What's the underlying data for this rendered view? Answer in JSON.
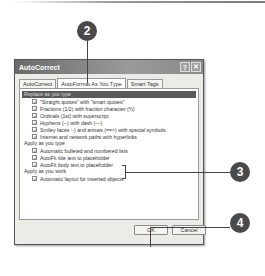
{
  "dialog": {
    "title": "AutoCorrect",
    "help_glyph": "?",
    "close_glyph": "✕",
    "tabs": [
      {
        "label": "AutoCorrect",
        "active": false
      },
      {
        "label": "AutoFormat As You Type",
        "active": true
      },
      {
        "label": "Smart Tags",
        "active": false
      }
    ],
    "section_header": "Replace as you type",
    "replace_options": [
      {
        "label": "\"Straight quotes\" with \"smart quotes\"",
        "checked": true
      },
      {
        "label": "Fractions (1/2) with fraction character (½)",
        "checked": true
      },
      {
        "label": "Ordinals (1st) with superscript",
        "checked": true
      },
      {
        "label": "Hyphens (--) with dash (—)",
        "checked": true
      },
      {
        "label": "Smiley faces :-) and arrows (==>) with special symbols",
        "checked": true
      },
      {
        "label": "Internet and network paths with hyperlinks",
        "checked": true
      }
    ],
    "apply_type_label": "Apply as you type",
    "apply_type_options": [
      {
        "label": "Automatic bulleted and numbered lists",
        "checked": true
      },
      {
        "label": "AutoFit title text to placeholder",
        "checked": true
      },
      {
        "label": "AutoFit body text to placeholder",
        "checked": true
      }
    ],
    "apply_work_label": "Apply as you work",
    "apply_work_options": [
      {
        "label": "Automatic layout for inserted objects",
        "checked": true
      }
    ],
    "ok_label": "OK",
    "cancel_label": "Cancel",
    "check_glyph": "✓"
  },
  "callouts": {
    "c2": "2",
    "c3": "3",
    "c4": "4"
  }
}
